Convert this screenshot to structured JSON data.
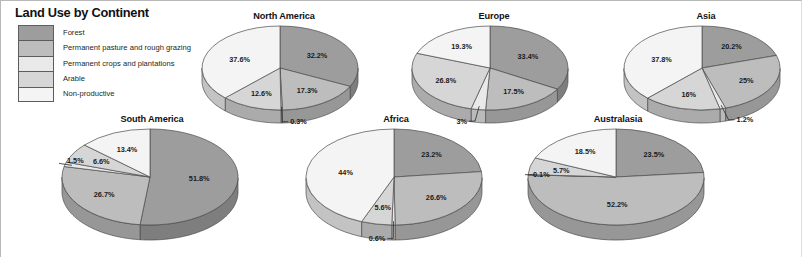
{
  "chart_title": "Land Use by Continent",
  "legend": {
    "items": [
      {
        "label": "Forest",
        "color": "#9d9d9d"
      },
      {
        "label": "Permanent pasture and rough grazing",
        "color": "#bdbdbd"
      },
      {
        "label": "Permanent crops and plantations",
        "color": "#e9e9e9"
      },
      {
        "label": "Arable",
        "color": "#d6d6d6"
      },
      {
        "label": "Non-productive",
        "color": "#f4f4f4"
      }
    ]
  },
  "chart_data": {
    "type": "pie",
    "title": "Land Use by Continent",
    "unit": "percent",
    "categories": [
      "Forest",
      "Permanent pasture and rough grazing",
      "Permanent crops and plantations",
      "Arable",
      "Non-productive"
    ],
    "category_colors": [
      "#9d9d9d",
      "#bdbdbd",
      "#e9e9e9",
      "#d6d6d6",
      "#f4f4f4"
    ],
    "legend_position": "top-left",
    "grid": false,
    "pies": [
      {
        "name": "North America",
        "values": [
          32.2,
          17.3,
          0.3,
          12.6,
          37.6
        ],
        "labels": [
          "32.2%",
          "17.3%",
          "0.3%",
          "12.6%",
          "37.6%"
        ]
      },
      {
        "name": "Europe",
        "values": [
          33.4,
          17.5,
          3,
          26.8,
          19.3
        ],
        "labels": [
          "33.4%",
          "17.5%",
          "3%",
          "26.8%",
          "19.3%"
        ]
      },
      {
        "name": "Asia",
        "values": [
          20.2,
          25,
          1.2,
          16,
          37.8
        ],
        "labels": [
          "20.2%",
          "25%",
          "1.2%",
          "16%",
          "37.8%"
        ]
      },
      {
        "name": "South America",
        "values": [
          51.8,
          26.7,
          1.5,
          6.6,
          13.4
        ],
        "labels": [
          "51.8%",
          "26.7%",
          "1.5%",
          "6.6%",
          "13.4%"
        ]
      },
      {
        "name": "Africa",
        "values": [
          23.2,
          26.6,
          0.6,
          5.6,
          44
        ],
        "labels": [
          "23.2%",
          "26.6%",
          "0.6%",
          "5.6%",
          "44%"
        ]
      },
      {
        "name": "Australasia",
        "values": [
          23.5,
          52.2,
          0.1,
          5.7,
          18.5
        ],
        "labels": [
          "23.5%",
          "52.2%",
          "0.1%",
          "5.7%",
          "18.5%"
        ]
      }
    ]
  },
  "layout": {
    "pies": [
      {
        "name": "North America",
        "left": 198,
        "top": 10,
        "width": 170,
        "rx": 78,
        "ry": 42,
        "depth": 13
      },
      {
        "name": "Europe",
        "left": 408,
        "top": 10,
        "width": 170,
        "rx": 78,
        "ry": 42,
        "depth": 13
      },
      {
        "name": "Asia",
        "left": 620,
        "top": 10,
        "width": 170,
        "rx": 78,
        "ry": 42,
        "depth": 13
      },
      {
        "name": "South America",
        "left": 58,
        "top": 113,
        "width": 186,
        "rx": 88,
        "ry": 48,
        "depth": 15
      },
      {
        "name": "Africa",
        "left": 302,
        "top": 113,
        "width": 186,
        "rx": 88,
        "ry": 48,
        "depth": 15
      },
      {
        "name": "Australasia",
        "left": 524,
        "top": 113,
        "width": 186,
        "rx": 88,
        "ry": 48,
        "depth": 15
      }
    ]
  }
}
